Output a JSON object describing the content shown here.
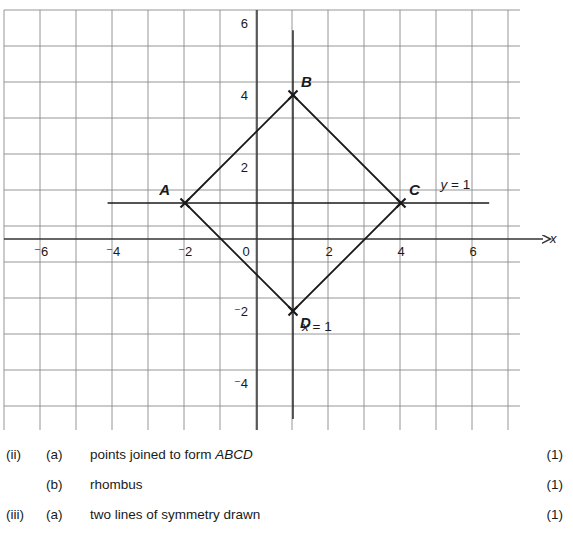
{
  "graph": {
    "grid": {
      "x_min_px": 4,
      "x_max_px": 520,
      "y_min_px": 10,
      "y_max_px": 430,
      "unit_px": 36,
      "origin_x_px": 257,
      "origin_y_px": 239,
      "grid_color": "#8a8a8a",
      "axis_color": "#333333",
      "shape_color": "#1a1a1a"
    },
    "x_axis": {
      "name": "x",
      "ticks": [
        {
          "value": "⁻6",
          "x": -6
        },
        {
          "value": "⁻4",
          "x": -4
        },
        {
          "value": "⁻2",
          "x": -2
        },
        {
          "value": "0",
          "x": 0
        },
        {
          "value": "2",
          "x": 2
        },
        {
          "value": "4",
          "x": 4
        },
        {
          "value": "6",
          "x": 6
        }
      ]
    },
    "y_axis": {
      "name": "y",
      "ticks": [
        {
          "value": "6",
          "y": 6
        },
        {
          "value": "4",
          "y": 4
        },
        {
          "value": "2",
          "y": 2
        },
        {
          "value": "⁻2",
          "y": -2
        },
        {
          "value": "⁻4",
          "y": -4
        }
      ]
    },
    "points": [
      {
        "label": "A",
        "x": -2,
        "y": 1,
        "label_dx": -15,
        "label_dy": -8
      },
      {
        "label": "B",
        "x": 1,
        "y": 4,
        "label_dx": 8,
        "label_dy": -8
      },
      {
        "label": "C",
        "x": 4,
        "y": 1,
        "label_dx": 8,
        "label_dy": -8
      },
      {
        "label": "D",
        "x": 1,
        "y": -2,
        "label_dx": 7,
        "label_dy": 17
      }
    ],
    "shape_name": "ABCD",
    "symmetry_lines": [
      {
        "label": "y = 1",
        "type": "horizontal",
        "value": 1,
        "from": -4.15,
        "to": 6.45,
        "label_x": 5.1,
        "label_y": 1.5
      },
      {
        "label": "x = 1",
        "type": "vertical",
        "value": 1,
        "from": 5.8,
        "to": -5.0,
        "label_x": 1.25,
        "label_y": -2.45
      }
    ]
  },
  "answers": {
    "rows": [
      {
        "num": "(ii)",
        "letter": "(a)",
        "text_plain": "points joined to form ",
        "text_italic": "ABCD",
        "mark": "(1)"
      },
      {
        "num": "",
        "letter": "(b)",
        "text_plain": "rhombus",
        "text_italic": "",
        "mark": "(1)"
      },
      {
        "num": "(iii)",
        "letter": "(a)",
        "text_plain": "two lines of symmetry drawn",
        "text_italic": "",
        "mark": "(1)"
      }
    ]
  }
}
